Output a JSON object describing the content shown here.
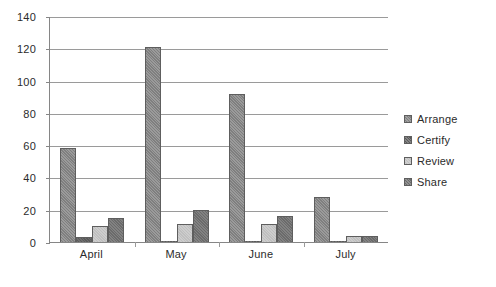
{
  "chart_data": {
    "type": "bar",
    "title": "",
    "subtitle": "",
    "xlabel": "",
    "ylabel": "",
    "categories": [
      "April",
      "May",
      "June",
      "July"
    ],
    "series": [
      {
        "name": "Arrange",
        "values": [
          58,
          121,
          92,
          28
        ],
        "color": "#7f7f7f"
      },
      {
        "name": "Certify",
        "values": [
          3,
          0,
          0,
          0
        ],
        "color": "#5a5a5a"
      },
      {
        "name": "Review",
        "values": [
          10,
          11,
          11,
          4
        ],
        "color": "#bfbfbf"
      },
      {
        "name": "Share",
        "values": [
          15,
          20,
          16,
          4
        ],
        "color": "#6b6b6b"
      }
    ],
    "ylim": [
      0,
      140
    ],
    "ytick_values": [
      0,
      20,
      40,
      60,
      80,
      100,
      120,
      140
    ],
    "ytick_labels": [
      "0",
      "20",
      "40",
      "60",
      "80",
      "100",
      "120",
      "140"
    ],
    "grid": true,
    "grid_axis": "y",
    "legend_position": "right",
    "annotations": []
  },
  "style": {
    "background": "#ffffff",
    "axis_color": "#868686",
    "grid_color": "#9a9a9a",
    "bar_border": "#5e5e5e",
    "text_color": "#2b2b2b"
  }
}
